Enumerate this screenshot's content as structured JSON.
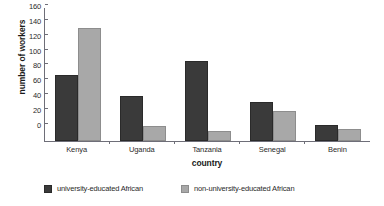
{
  "chart_data": {
    "type": "bar",
    "title": "",
    "xlabel": "country",
    "ylabel": "number of workers",
    "categories": [
      "Kenya",
      "Uganda",
      "Tanzania",
      "Senegal",
      "Benin"
    ],
    "series": [
      {
        "name": "university-educated African",
        "color": "#3a3a3a",
        "values": [
          89,
          60,
          108,
          52,
          22
        ]
      },
      {
        "name": "non-university-educated African",
        "color": "#a8a8a8",
        "values": [
          152,
          20,
          13,
          40,
          16
        ]
      }
    ],
    "ylim": [
      0,
      180
    ],
    "yticks": [
      0,
      20,
      40,
      60,
      80,
      100,
      120,
      140,
      160,
      180
    ],
    "grid": false,
    "legend_position": "bottom"
  }
}
